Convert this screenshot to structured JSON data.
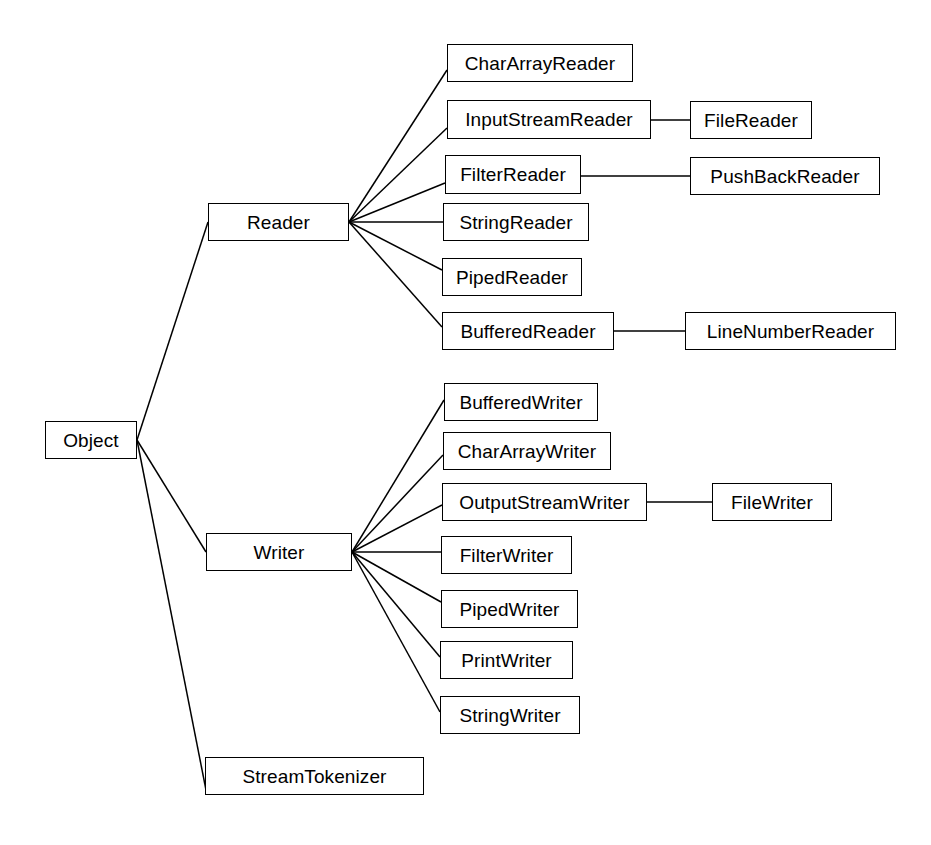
{
  "diagram": {
    "type": "class-hierarchy-tree",
    "background_color": "#ffffff",
    "line_color": "#000000",
    "text_color": "#000000",
    "nodes": [
      {
        "id": "object",
        "label": "Object",
        "x": 45,
        "y": 421,
        "w": 92,
        "h": 38
      },
      {
        "id": "reader",
        "label": "Reader",
        "x": 208,
        "y": 203,
        "w": 141,
        "h": 38
      },
      {
        "id": "writer",
        "label": "Writer",
        "x": 206,
        "y": 533,
        "w": 146,
        "h": 38
      },
      {
        "id": "streamtokenizer",
        "label": "StreamTokenizer",
        "x": 205,
        "y": 757,
        "w": 219,
        "h": 38
      },
      {
        "id": "chararrayreader",
        "label": "CharArrayReader",
        "x": 447,
        "y": 44,
        "w": 186,
        "h": 38
      },
      {
        "id": "inputstreamreader",
        "label": "InputStreamReader",
        "x": 447,
        "y": 100,
        "w": 204,
        "h": 39
      },
      {
        "id": "filterreader",
        "label": "FilterReader",
        "x": 445,
        "y": 155,
        "w": 136,
        "h": 39
      },
      {
        "id": "stringreader",
        "label": "StringReader",
        "x": 443,
        "y": 203,
        "w": 146,
        "h": 38
      },
      {
        "id": "pipedreader",
        "label": "PipedReader",
        "x": 442,
        "y": 258,
        "w": 140,
        "h": 38
      },
      {
        "id": "bufferedreader",
        "label": "BufferedReader",
        "x": 442,
        "y": 312,
        "w": 172,
        "h": 38
      },
      {
        "id": "filereader",
        "label": "FileReader",
        "x": 690,
        "y": 101,
        "w": 122,
        "h": 38
      },
      {
        "id": "pushbackreader",
        "label": "PushBackReader",
        "x": 690,
        "y": 157,
        "w": 190,
        "h": 38
      },
      {
        "id": "linenumberreader",
        "label": "LineNumberReader",
        "x": 685,
        "y": 312,
        "w": 211,
        "h": 38
      },
      {
        "id": "bufferedwriter",
        "label": "BufferedWriter",
        "x": 444,
        "y": 383,
        "w": 154,
        "h": 38
      },
      {
        "id": "chararraywriter",
        "label": "CharArrayWriter",
        "x": 443,
        "y": 432,
        "w": 168,
        "h": 38
      },
      {
        "id": "outputstreamwriter",
        "label": "OutputStreamWriter",
        "x": 442,
        "y": 483,
        "w": 205,
        "h": 38
      },
      {
        "id": "filterwriter",
        "label": "FilterWriter",
        "x": 441,
        "y": 536,
        "w": 131,
        "h": 38
      },
      {
        "id": "pipedwriter",
        "label": "PipedWriter",
        "x": 441,
        "y": 590,
        "w": 137,
        "h": 38
      },
      {
        "id": "printwriter",
        "label": "PrintWriter",
        "x": 440,
        "y": 641,
        "w": 133,
        "h": 38
      },
      {
        "id": "stringwriter",
        "label": "StringWriter",
        "x": 440,
        "y": 696,
        "w": 140,
        "h": 38
      },
      {
        "id": "filewriter",
        "label": "FileWriter",
        "x": 712,
        "y": 483,
        "w": 120,
        "h": 38
      }
    ],
    "edges": [
      {
        "from": "object",
        "to": "reader",
        "x1": 137,
        "y1": 440,
        "x2": 208,
        "y2": 222
      },
      {
        "from": "object",
        "to": "writer",
        "x1": 137,
        "y1": 440,
        "x2": 206,
        "y2": 552
      },
      {
        "from": "object",
        "to": "streamtokenizer",
        "x1": 137,
        "y1": 440,
        "x2": 206,
        "y2": 790
      },
      {
        "from": "reader",
        "to": "chararrayreader",
        "x1": 349,
        "y1": 222,
        "x2": 447,
        "y2": 70
      },
      {
        "from": "reader",
        "to": "inputstreamreader",
        "x1": 349,
        "y1": 222,
        "x2": 447,
        "y2": 128
      },
      {
        "from": "reader",
        "to": "filterreader",
        "x1": 349,
        "y1": 222,
        "x2": 445,
        "y2": 183
      },
      {
        "from": "reader",
        "to": "stringreader",
        "x1": 349,
        "y1": 222,
        "x2": 443,
        "y2": 222
      },
      {
        "from": "reader",
        "to": "pipedreader",
        "x1": 349,
        "y1": 222,
        "x2": 442,
        "y2": 270
      },
      {
        "from": "reader",
        "to": "bufferedreader",
        "x1": 349,
        "y1": 222,
        "x2": 442,
        "y2": 327
      },
      {
        "from": "inputstreamreader",
        "to": "filereader",
        "x1": 651,
        "y1": 120,
        "x2": 690,
        "y2": 120
      },
      {
        "from": "filterreader",
        "to": "pushbackreader",
        "x1": 581,
        "y1": 176,
        "x2": 690,
        "y2": 176
      },
      {
        "from": "bufferedreader",
        "to": "linenumberreader",
        "x1": 614,
        "y1": 331,
        "x2": 685,
        "y2": 331
      },
      {
        "from": "writer",
        "to": "bufferedwriter",
        "x1": 352,
        "y1": 552,
        "x2": 444,
        "y2": 400
      },
      {
        "from": "writer",
        "to": "chararraywriter",
        "x1": 352,
        "y1": 552,
        "x2": 443,
        "y2": 455
      },
      {
        "from": "writer",
        "to": "outputstreamwriter",
        "x1": 352,
        "y1": 552,
        "x2": 442,
        "y2": 505
      },
      {
        "from": "writer",
        "to": "filterwriter",
        "x1": 352,
        "y1": 552,
        "x2": 441,
        "y2": 552
      },
      {
        "from": "writer",
        "to": "pipedwriter",
        "x1": 352,
        "y1": 552,
        "x2": 441,
        "y2": 602
      },
      {
        "from": "writer",
        "to": "printwriter",
        "x1": 352,
        "y1": 552,
        "x2": 440,
        "y2": 657
      },
      {
        "from": "writer",
        "to": "stringwriter",
        "x1": 352,
        "y1": 552,
        "x2": 440,
        "y2": 712
      },
      {
        "from": "outputstreamwriter",
        "to": "filewriter",
        "x1": 647,
        "y1": 502,
        "x2": 712,
        "y2": 502
      }
    ]
  }
}
